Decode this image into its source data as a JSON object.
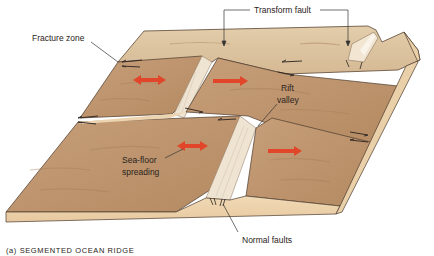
{
  "figure": {
    "caption": "(a) SEGMENTED OCEAN RIDGE",
    "labels": {
      "transform_fault": "Transform fault",
      "fracture_zone": "Fracture zone",
      "rift_valley_line1": "Rift",
      "rift_valley_line2": "valley",
      "sea_floor_line1": "Sea-floor",
      "sea_floor_line2": "spreading",
      "normal_faults": "Normal faults"
    },
    "colors": {
      "upper_surface": "#c9a27c",
      "far_surface": "#dcc3a0",
      "front_face": "#ecd2ad",
      "rift_wall": "#efe4d2",
      "spreading_arrow": "#e2462a",
      "outline": "#4a3a2c",
      "leader_line": "#333333"
    },
    "icons": {
      "spreading_arrow": "double-headed-red-arrow",
      "slip_arrow": "half-arrow-slip-indicator"
    }
  }
}
